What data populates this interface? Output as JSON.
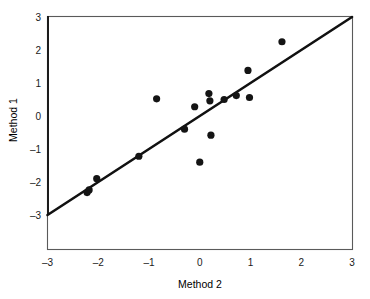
{
  "figure": {
    "background": "#ffffff",
    "marker_color": "#141414",
    "line_color": "#111111",
    "frame_color": "#5a5a5a"
  },
  "chart_data": {
    "type": "scatter",
    "title": "",
    "xlabel": "Method 2",
    "ylabel": "Method 1",
    "xlim": [
      -3,
      3
    ],
    "ylim": [
      -3,
      3
    ],
    "xticks": [
      -3,
      -2,
      -1,
      0,
      1,
      2,
      3
    ],
    "yticks": [
      -3,
      -2,
      -1,
      0,
      1,
      2,
      3
    ],
    "xtick_labels": [
      "-3",
      "-2",
      "-1",
      "0",
      "1",
      "2",
      "3"
    ],
    "ytick_labels": [
      "-3",
      "-2",
      "-1",
      "0",
      "1",
      "2",
      "3"
    ],
    "grid": false,
    "legend": false,
    "legend_position": "none",
    "series": [
      {
        "name": "observations",
        "type": "scatter",
        "marker": "circle",
        "marker_color": "#141414",
        "points": [
          {
            "x": -2.22,
            "y": -2.32
          },
          {
            "x": -2.18,
            "y": -2.24
          },
          {
            "x": -2.03,
            "y": -1.9
          },
          {
            "x": -1.2,
            "y": -1.22
          },
          {
            "x": -0.85,
            "y": 0.52
          },
          {
            "x": -0.3,
            "y": -0.4
          },
          {
            "x": -0.1,
            "y": 0.28
          },
          {
            "x": 0.0,
            "y": -1.4
          },
          {
            "x": 0.18,
            "y": 0.68
          },
          {
            "x": 0.2,
            "y": 0.46
          },
          {
            "x": 0.22,
            "y": -0.58
          },
          {
            "x": 0.48,
            "y": 0.5
          },
          {
            "x": 0.72,
            "y": 0.62
          },
          {
            "x": 0.95,
            "y": 1.38
          },
          {
            "x": 0.98,
            "y": 0.56
          },
          {
            "x": 1.62,
            "y": 2.25
          }
        ]
      },
      {
        "name": "identity-fit-line",
        "type": "line",
        "line_color": "#111111",
        "x": [
          -3,
          3
        ],
        "y": [
          -3,
          3
        ]
      }
    ]
  }
}
